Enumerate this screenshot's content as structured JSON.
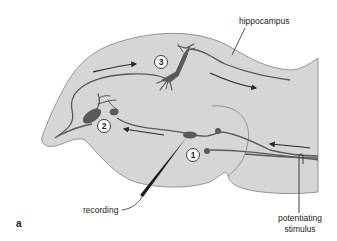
{
  "figure": {
    "panel_label": "a",
    "colors": {
      "tissue_fill": "#d6d6d6",
      "tissue_outline": "#8a8a8a",
      "neuron": "#5a5a5a",
      "arrow": "#2a2a2a",
      "background": "#ffffff"
    },
    "labels": {
      "hippocampus": "hippocampus",
      "recording": "recording",
      "stimulus_line1": "potentiating",
      "stimulus_line2": "stimulus"
    },
    "neurons": [
      {
        "id": "1",
        "label": "1"
      },
      {
        "id": "2",
        "label": "2"
      },
      {
        "id": "3",
        "label": "3"
      }
    ]
  }
}
